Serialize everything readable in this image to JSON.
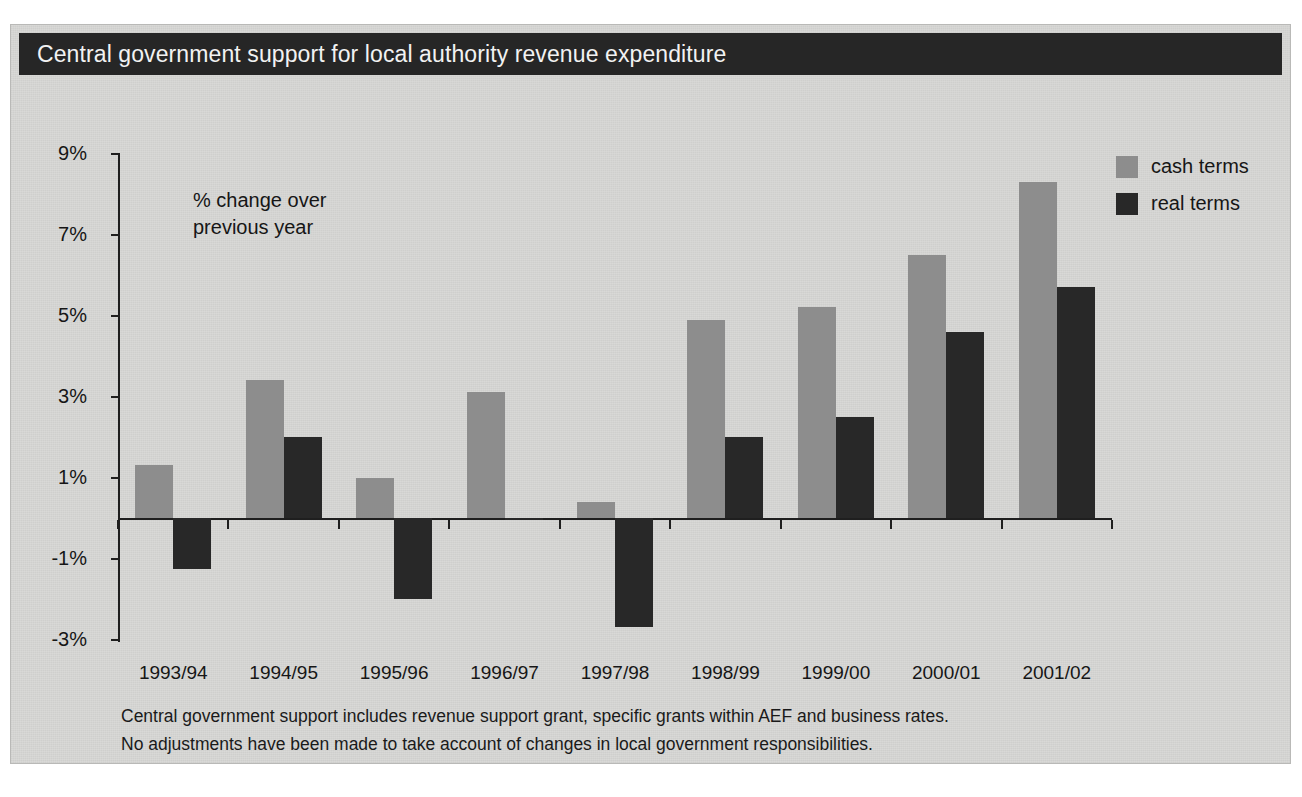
{
  "figure": {
    "title": "Central government support for local authority revenue expenditure",
    "annotation_line1": "% change over",
    "annotation_line2": "previous year",
    "footnotes": [
      "Central government support includes revenue support grant, specific grants within AEF and business rates.",
      "No adjustments have been made to take account of changes in local government responsibilities."
    ],
    "colors": {
      "title_bar": "#262626",
      "panel": "#d8d8d6",
      "cash": "#8d8d8d",
      "real": "#282828",
      "axis": "#1f1f1f"
    }
  },
  "chart_data": {
    "type": "bar",
    "title": "Central government support for local authority revenue expenditure",
    "subtitle": "% change over previous year",
    "xlabel": "",
    "ylabel": "% change over previous year",
    "ylim": [
      -3,
      9
    ],
    "yticks": [
      -3,
      -1,
      1,
      3,
      5,
      7,
      9
    ],
    "ytick_labels": [
      "-3%",
      "-1%",
      "1%",
      "3%",
      "5%",
      "7%",
      "9%"
    ],
    "grid": false,
    "legend_position": "top-right",
    "categories": [
      "1993/94",
      "1994/95",
      "1995/96",
      "1996/97",
      "1997/98",
      "1998/99",
      "1999/00",
      "2000/01",
      "2001/02"
    ],
    "series": [
      {
        "name": "cash terms",
        "color": "#8d8d8d",
        "values": [
          1.3,
          3.4,
          1.0,
          3.1,
          0.4,
          4.9,
          5.2,
          6.5,
          8.3
        ]
      },
      {
        "name": "real terms",
        "color": "#282828",
        "values": [
          -1.25,
          2.0,
          -2.0,
          -0.05,
          -2.7,
          2.0,
          2.5,
          4.6,
          5.7
        ]
      }
    ]
  }
}
